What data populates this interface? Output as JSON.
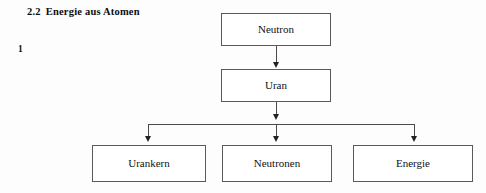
{
  "document": {
    "section_number": "2.2",
    "section_title": "Energie aus Atomen",
    "figure_number": "1"
  },
  "diagram": {
    "type": "flowchart",
    "nodes": [
      {
        "id": "neutron",
        "label": "Neutron",
        "level": 0
      },
      {
        "id": "uran",
        "label": "Uran",
        "level": 1
      },
      {
        "id": "urankern",
        "label": "Urankern",
        "level": 2
      },
      {
        "id": "neutronen",
        "label": "Neutronen",
        "level": 2
      },
      {
        "id": "energie",
        "label": "Energie",
        "level": 2
      }
    ],
    "edges": [
      {
        "from": "neutron",
        "to": "uran"
      },
      {
        "from": "uran",
        "to": "urankern"
      },
      {
        "from": "uran",
        "to": "neutronen"
      },
      {
        "from": "uran",
        "to": "energie"
      }
    ],
    "colors": {
      "box_border": "#5a5a5a",
      "box_fill": "#ffffff",
      "connector": "#4a4a4a",
      "text": "#111111",
      "page_background": "#fdfdfd"
    }
  }
}
